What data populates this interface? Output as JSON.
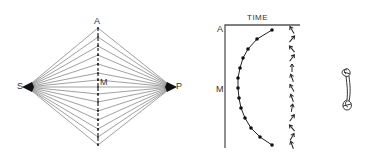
{
  "left_diagram": {
    "labels": {
      "source": "S",
      "target": "P",
      "top": "A",
      "middle": "M"
    },
    "geometry": {
      "source": [
        27,
        87
      ],
      "target": [
        172,
        87
      ],
      "axis_x": 98,
      "axis_top": 28,
      "axis_bottom": 145,
      "fan_points_y": [
        28,
        37,
        46,
        55,
        64,
        73,
        80,
        87,
        94,
        102,
        111,
        120,
        129,
        137,
        145
      ]
    },
    "line_color": "#888888",
    "axis_style": "dashed"
  },
  "right_diagram": {
    "axis_label": "TIME",
    "labels": {
      "top": "A",
      "middle": "M"
    },
    "curve_points": [
      [
        272,
        30
      ],
      [
        257,
        39
      ],
      [
        248,
        49
      ],
      [
        243,
        58
      ],
      [
        240,
        68
      ],
      [
        238,
        78
      ],
      [
        238,
        88
      ],
      [
        239,
        98
      ],
      [
        241,
        108
      ],
      [
        245,
        118
      ],
      [
        251,
        128
      ],
      [
        260,
        137
      ],
      [
        272,
        145
      ]
    ],
    "arrow_column_x": 292,
    "arrow_angles": [
      -30,
      40,
      -40,
      35,
      0,
      -20,
      -30,
      -20,
      10,
      35,
      -40,
      30,
      -20
    ],
    "squiggle_figure": "figure-eight trajectory"
  }
}
